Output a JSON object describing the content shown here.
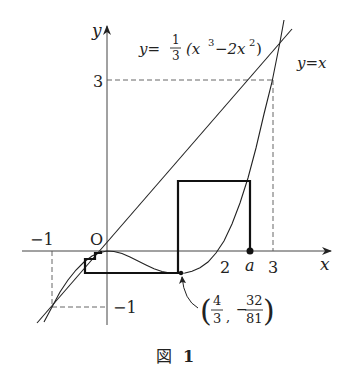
{
  "figure": {
    "caption": "図 1",
    "caption_label": "図",
    "caption_number": "1"
  },
  "axes": {
    "x_label": "x",
    "y_label": "y",
    "origin_label": "O",
    "x_ticks": [
      "−1",
      "2",
      "a",
      "3"
    ],
    "y_ticks": [
      "3",
      "−1"
    ]
  },
  "curves": {
    "cubic_label_lhs": "y=",
    "cubic_frac_num": "1",
    "cubic_frac_den": "3",
    "cubic_expr": "(x",
    "cubic_exp1": "3",
    "cubic_mid": "−2x",
    "cubic_exp2": "2",
    "cubic_close": ")",
    "line_label": "y=x"
  },
  "annotation": {
    "min_point_x_num": "4",
    "min_point_x_den": "3",
    "min_point_y_sign": "−",
    "min_point_y_num": "32",
    "min_point_y_den": "81"
  },
  "colors": {
    "ink": "#222222",
    "background": "#ffffff"
  }
}
